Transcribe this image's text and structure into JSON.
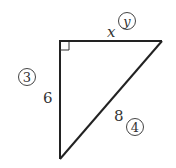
{
  "figure": {
    "type": "right-triangle",
    "colors": {
      "stroke": "#222222",
      "text": "#333333",
      "background": "#ffffff"
    },
    "vertices": {
      "right_angle": [
        59,
        41
      ],
      "top_right": [
        162,
        41
      ],
      "bottom": [
        60,
        159
      ]
    },
    "sides": {
      "top": {
        "label": "x",
        "marker": "y"
      },
      "left": {
        "label": "6",
        "marker": "3"
      },
      "hypotenuse": {
        "label": "8",
        "marker": "4"
      }
    }
  }
}
